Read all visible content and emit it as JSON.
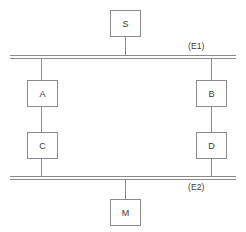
{
  "diagram": {
    "colors": {
      "line": "#8a8a8a",
      "text": "#3a3a3a",
      "background": "#ffffff"
    },
    "nodes": [
      {
        "id": "S",
        "label": "S",
        "x": 110,
        "y": 10,
        "w": 31,
        "h": 27
      },
      {
        "id": "A",
        "label": "A",
        "x": 27,
        "y": 80,
        "w": 31,
        "h": 27
      },
      {
        "id": "B",
        "label": "B",
        "x": 196,
        "y": 80,
        "w": 31,
        "h": 27
      },
      {
        "id": "C",
        "label": "C",
        "x": 27,
        "y": 132,
        "w": 31,
        "h": 27
      },
      {
        "id": "D",
        "label": "D",
        "x": 196,
        "y": 132,
        "w": 31,
        "h": 27
      },
      {
        "id": "M",
        "label": "M",
        "x": 110,
        "y": 199,
        "w": 31,
        "h": 27
      }
    ],
    "buses": [
      {
        "id": "E1",
        "label": "(E1)",
        "x": 10,
        "y": 55,
        "w": 226,
        "label_x": 188,
        "label_y": 41
      },
      {
        "id": "E2",
        "label": "(E2)",
        "x": 10,
        "y": 176,
        "w": 226,
        "label_x": 188,
        "label_y": 182
      }
    ],
    "links": [
      {
        "id": "s-to-e1",
        "x": 125,
        "y": 37,
        "h": 19
      },
      {
        "id": "e1-to-a",
        "x": 41,
        "y": 56,
        "h": 25
      },
      {
        "id": "a-to-c",
        "x": 41,
        "y": 106,
        "h": 27
      },
      {
        "id": "c-to-e2",
        "x": 41,
        "y": 158,
        "h": 20
      },
      {
        "id": "e1-to-b",
        "x": 211,
        "y": 56,
        "h": 25
      },
      {
        "id": "b-to-d",
        "x": 211,
        "y": 106,
        "h": 27
      },
      {
        "id": "d-to-e2",
        "x": 211,
        "y": 158,
        "h": 20
      },
      {
        "id": "e2-to-m",
        "x": 125,
        "y": 178,
        "h": 22
      }
    ]
  }
}
